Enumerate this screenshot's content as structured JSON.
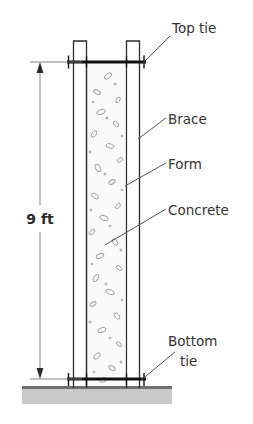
{
  "diagram": {
    "dimension": {
      "label": "9 ft",
      "value": 9,
      "unit": "ft",
      "orientation": "vertical",
      "arrow_style": "double-filled"
    },
    "callouts": [
      {
        "id": "top-tie",
        "label": "Top tie",
        "line2": ""
      },
      {
        "id": "brace",
        "label": "Brace",
        "line2": ""
      },
      {
        "id": "form",
        "label": "Form",
        "line2": ""
      },
      {
        "id": "concrete",
        "label": "Concrete",
        "line2": ""
      },
      {
        "id": "bottom-tie",
        "label": "Bottom",
        "line2": "tie"
      }
    ],
    "colors": {
      "stroke": "#2b2b2b",
      "text": "#333333",
      "leader": "#555555",
      "ground": "#c9c9c9",
      "ground_top": "#6f6f6f",
      "concrete_fill": "#fafafa",
      "aggregate": "#9a9a9a",
      "form_fill": "#ffffff",
      "background": "#ffffff"
    }
  }
}
